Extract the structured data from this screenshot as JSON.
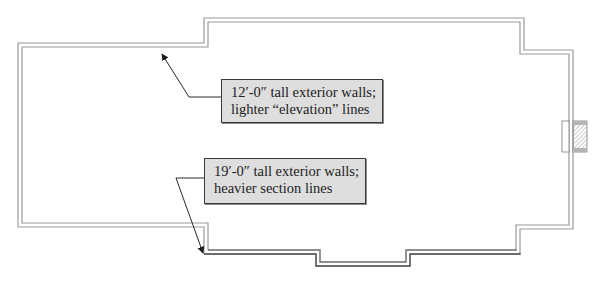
{
  "diagram": {
    "type": "floor-plan-outline",
    "colors": {
      "wall_light": "#9a9a9a",
      "wall_heavy": "#3c3c3c",
      "callout_fill": "#dedede",
      "callout_border": "#3a3a3a",
      "leader": "#2a2a2a"
    },
    "callouts": [
      {
        "id": "light-walls",
        "line1": "12′-0″ tall exterior walls;",
        "line2": "lighter “elevation” lines"
      },
      {
        "id": "heavy-walls",
        "line1": "19′-0″ tall exterior walls;",
        "line2": "heavier section lines"
      }
    ],
    "features": [
      "chimney-detail"
    ]
  }
}
